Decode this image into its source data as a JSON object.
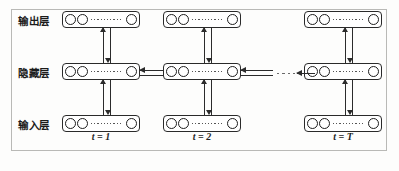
{
  "figure": {
    "frame_color": "#b9b9b6",
    "ink_color": "#2b2b2b",
    "background": "#fdfdfc"
  },
  "layers": [
    {
      "id": "output",
      "label": "输出层",
      "row": "top"
    },
    {
      "id": "hidden",
      "label": "隐藏层",
      "row": "middle"
    },
    {
      "id": "input",
      "label": "输入层",
      "row": "bottom"
    }
  ],
  "timesteps": [
    {
      "id": "t1",
      "caption": "t = 1"
    },
    {
      "id": "t2",
      "caption": "t = 2"
    },
    {
      "id": "tT",
      "caption": "t = T"
    }
  ],
  "node_group": {
    "visible_units": 3,
    "ellipsis": "·········",
    "unit_shape": "circle"
  },
  "connections": {
    "input_to_hidden": "up",
    "hidden_to_output": "up",
    "recurrent_direction": "left",
    "recurrent_label": "",
    "continuation_marker": "·  ·  ·"
  }
}
